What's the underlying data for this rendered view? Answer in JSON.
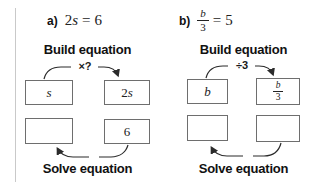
{
  "panel_a": {
    "label": "a)",
    "eq_coeff": "2",
    "eq_var": "s",
    "eq_equals": "=",
    "eq_value": "6",
    "build_label": "Build equation",
    "op_label": "×?",
    "box_top_left_var": "s",
    "box_top_right_coeff": "2",
    "box_top_right_var": "s",
    "box_bottom_left": "",
    "box_bottom_right": "6",
    "solve_label": "Solve equation"
  },
  "panel_b": {
    "label": "b)",
    "eq_frac_num": "b",
    "eq_frac_den": "3",
    "eq_equals": "=",
    "eq_value": "5",
    "build_label": "Build equation",
    "op_label": "÷3",
    "box_top_left_var": "b",
    "box_top_right_frac_num": "b",
    "box_top_right_frac_den": "3",
    "box_bottom_left": "",
    "box_bottom_right": "",
    "solve_label": "Solve equation"
  },
  "colors": {
    "divider": "#c9c9c9",
    "box_border": "#6e6e6e",
    "arrow": "#2b2b2b"
  }
}
